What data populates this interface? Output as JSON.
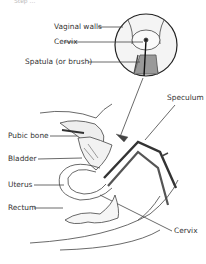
{
  "caption": "Step ...",
  "labels": {
    "vaginal_walls": "Vaginal walls",
    "cervix_top": "Cervix",
    "spatula": "Spatula (or brush)",
    "speculum": "Speculum",
    "pubic_bone": "Pubic bone",
    "bladder": "Bladder",
    "uterus": "Uterus",
    "rectum": "Rectum",
    "cervix_bottom": "Cervix"
  }
}
